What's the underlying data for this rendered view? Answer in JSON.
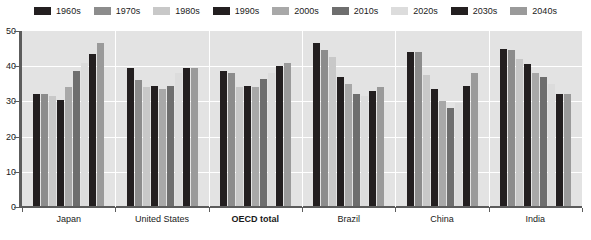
{
  "legend": {
    "position": "top",
    "items": [
      {
        "label": "1960s",
        "color": "#231f20"
      },
      {
        "label": "1970s",
        "color": "#8c8c8c"
      },
      {
        "label": "1980s",
        "color": "#c8c8c8"
      },
      {
        "label": "1990s",
        "color": "#231f20"
      },
      {
        "label": "2000s",
        "color": "#a8a8a8"
      },
      {
        "label": "2010s",
        "color": "#6e6e6e"
      },
      {
        "label": "2020s",
        "color": "#dcdcdc"
      },
      {
        "label": "2030s",
        "color": "#231f20"
      },
      {
        "label": "2040s",
        "color": "#9a9a9a"
      }
    ]
  },
  "axes": {
    "y_ticks": [
      "50",
      "40",
      "30",
      "20",
      "10",
      "0"
    ],
    "y_min": 0,
    "y_max": 50
  },
  "footnote": "",
  "chart_data": {
    "type": "bar",
    "title": "",
    "subtitle": "",
    "xlabel": "",
    "ylabel": "",
    "ylim": [
      0,
      50
    ],
    "ytick_step": 10,
    "grid": true,
    "legend_position": "top",
    "categories": [
      "Japan",
      "United States",
      "OECD total",
      "Brazil",
      "China",
      "India"
    ],
    "highlighted_category": "OECD total",
    "series": [
      {
        "name": "1960s",
        "color": "#231f20",
        "values": [
          32.0,
          39.5,
          38.5,
          46.5,
          44.0,
          45.0
        ]
      },
      {
        "name": "1970s",
        "color": "#8c8c8c",
        "values": [
          32.0,
          36.0,
          38.0,
          44.5,
          44.0,
          44.5
        ]
      },
      {
        "name": "1980s",
        "color": "#c8c8c8",
        "values": [
          31.5,
          34.0,
          34.0,
          42.5,
          37.5,
          42.0
        ]
      },
      {
        "name": "1990s",
        "color": "#231f20",
        "values": [
          30.5,
          34.5,
          34.5,
          37.0,
          33.5,
          40.5
        ]
      },
      {
        "name": "2000s",
        "color": "#a8a8a8",
        "values": [
          34.0,
          33.5,
          34.0,
          35.0,
          30.0,
          38.0
        ]
      },
      {
        "name": "2010s",
        "color": "#6e6e6e",
        "values": [
          38.5,
          34.5,
          36.5,
          32.0,
          28.0,
          37.0
        ]
      },
      {
        "name": "2020s",
        "color": "#dcdcdc",
        "values": [
          41.0,
          38.0,
          38.0,
          31.5,
          29.5,
          35.0
        ]
      },
      {
        "name": "2030s",
        "color": "#231f20",
        "values": [
          43.5,
          39.5,
          40.0,
          33.0,
          34.5,
          32.0
        ]
      },
      {
        "name": "2040s",
        "color": "#9a9a9a",
        "values": [
          46.5,
          39.5,
          41.0,
          34.0,
          38.0,
          32.0
        ]
      }
    ]
  }
}
